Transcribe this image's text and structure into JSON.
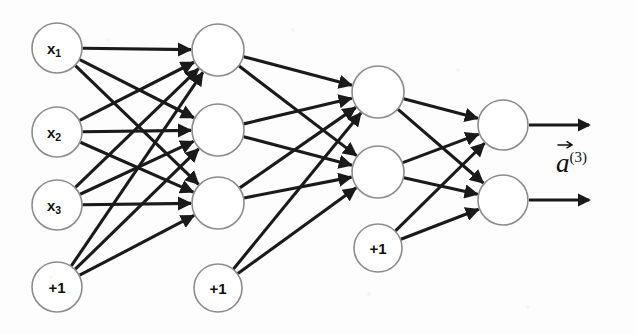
{
  "diagram": {
    "type": "neural-network",
    "background_color": "#fdfdfd",
    "node_stroke_color": "#8c8c8c",
    "edge_color": "#1a1a1a",
    "node_radius": 25,
    "layers": [
      {
        "id": "layer-1",
        "role": "input",
        "x": 57,
        "nodes": [
          {
            "id": "n-x1",
            "label": "x",
            "subscript": "1",
            "y": 48,
            "r": 25,
            "kind": "input"
          },
          {
            "id": "n-x2",
            "label": "x",
            "subscript": "2",
            "y": 132,
            "r": 25,
            "kind": "input"
          },
          {
            "id": "n-x3",
            "label": "x",
            "subscript": "3",
            "y": 205,
            "r": 25,
            "kind": "input"
          },
          {
            "id": "n-b1",
            "label": "+1",
            "subscript": "",
            "y": 287,
            "r": 25,
            "kind": "bias"
          }
        ]
      },
      {
        "id": "layer-2",
        "role": "hidden",
        "x": 218,
        "nodes": [
          {
            "id": "n-h11",
            "label": "",
            "subscript": "",
            "y": 50,
            "r": 26,
            "kind": "hidden"
          },
          {
            "id": "n-h12",
            "label": "",
            "subscript": "",
            "y": 130,
            "r": 26,
            "kind": "hidden"
          },
          {
            "id": "n-h13",
            "label": "",
            "subscript": "",
            "y": 203,
            "r": 26,
            "kind": "hidden"
          },
          {
            "id": "n-b2",
            "label": "+1",
            "subscript": "",
            "y": 288,
            "r": 24,
            "kind": "bias"
          }
        ]
      },
      {
        "id": "layer-3",
        "role": "hidden",
        "x": 378,
        "nodes": [
          {
            "id": "n-h21",
            "label": "",
            "subscript": "",
            "y": 92,
            "r": 26,
            "kind": "hidden"
          },
          {
            "id": "n-h22",
            "label": "",
            "subscript": "",
            "y": 172,
            "r": 26,
            "kind": "hidden"
          },
          {
            "id": "n-b3",
            "label": "+1",
            "subscript": "",
            "y": 248,
            "r": 24,
            "kind": "bias"
          }
        ]
      },
      {
        "id": "layer-4",
        "role": "output",
        "x": 503,
        "nodes": [
          {
            "id": "n-o1",
            "label": "",
            "subscript": "",
            "y": 125,
            "r": 25,
            "kind": "output"
          },
          {
            "id": "n-o2",
            "label": "",
            "subscript": "",
            "y": 200,
            "r": 25,
            "kind": "output"
          }
        ]
      }
    ],
    "edges": [
      {
        "from": "n-x1",
        "to": "n-h11"
      },
      {
        "from": "n-x1",
        "to": "n-h12"
      },
      {
        "from": "n-x1",
        "to": "n-h13"
      },
      {
        "from": "n-x2",
        "to": "n-h11"
      },
      {
        "from": "n-x2",
        "to": "n-h12"
      },
      {
        "from": "n-x2",
        "to": "n-h13"
      },
      {
        "from": "n-x3",
        "to": "n-h11"
      },
      {
        "from": "n-x3",
        "to": "n-h12"
      },
      {
        "from": "n-x3",
        "to": "n-h13"
      },
      {
        "from": "n-b1",
        "to": "n-h11"
      },
      {
        "from": "n-b1",
        "to": "n-h12"
      },
      {
        "from": "n-b1",
        "to": "n-h13"
      },
      {
        "from": "n-h11",
        "to": "n-h21"
      },
      {
        "from": "n-h11",
        "to": "n-h22"
      },
      {
        "from": "n-h12",
        "to": "n-h21"
      },
      {
        "from": "n-h12",
        "to": "n-h22"
      },
      {
        "from": "n-h13",
        "to": "n-h21"
      },
      {
        "from": "n-h13",
        "to": "n-h22"
      },
      {
        "from": "n-b2",
        "to": "n-h21"
      },
      {
        "from": "n-b2",
        "to": "n-h22"
      },
      {
        "from": "n-h21",
        "to": "n-o1"
      },
      {
        "from": "n-h21",
        "to": "n-o2"
      },
      {
        "from": "n-h22",
        "to": "n-o1"
      },
      {
        "from": "n-h22",
        "to": "n-o2"
      },
      {
        "from": "n-b3",
        "to": "n-o1"
      },
      {
        "from": "n-b3",
        "to": "n-o2"
      }
    ],
    "output_arrows": [
      {
        "id": "arrow-o1",
        "from": "n-o1",
        "x1": 529,
        "y1": 125,
        "x2": 589,
        "y2": 125
      },
      {
        "id": "arrow-o2",
        "from": "n-o2",
        "x1": 529,
        "y1": 200,
        "x2": 589,
        "y2": 200
      }
    ],
    "annotations": [
      {
        "id": "label-a3",
        "base": "a",
        "superscript": "(3)",
        "has_vector_arrow": true,
        "x": 556,
        "y": 150
      }
    ]
  }
}
